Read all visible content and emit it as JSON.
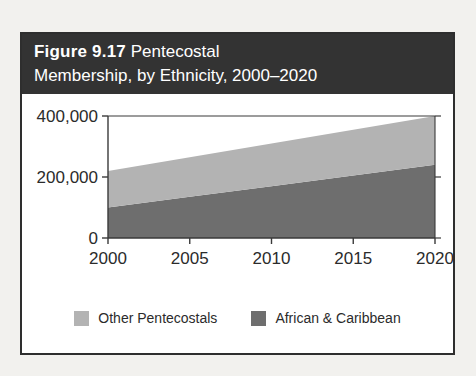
{
  "figure": {
    "caption_label": "Figure 9.17",
    "caption_text_line1": "Pentecostal",
    "caption_text_line2": "Membership, by Ethnicity, 2000–2020",
    "band_color": "#333333",
    "border_color": "#2e2e2e"
  },
  "legend": {
    "items": [
      {
        "label": "Other Pentecostals",
        "color": "#b3b3b3"
      },
      {
        "label": "African & Caribbean",
        "color": "#6e6e6e"
      }
    ]
  },
  "axes": {
    "y_ticks": [
      "0",
      "200,000",
      "400,000"
    ],
    "x_ticks": [
      "2000",
      "2005",
      "2010",
      "2015",
      "2020"
    ]
  },
  "chart_data": {
    "type": "area",
    "stacked": true,
    "title": "Figure 9.17 Pentecostal Membership, by Ethnicity, 2000–2020",
    "xlabel": "",
    "ylabel": "",
    "x": [
      2000,
      2005,
      2010,
      2015,
      2020
    ],
    "xlim": [
      2000,
      2020
    ],
    "ylim": [
      0,
      400000
    ],
    "yticks": [
      0,
      200000,
      400000
    ],
    "ytick_labels": [
      "0",
      "200,000",
      "400,000"
    ],
    "xticks": [
      2000,
      2005,
      2010,
      2015,
      2020
    ],
    "xtick_labels": [
      "2000",
      "2005",
      "2010",
      "2015",
      "2020"
    ],
    "grid": false,
    "legend_position": "bottom",
    "series": [
      {
        "name": "African & Caribbean",
        "color": "#6e6e6e",
        "values": [
          100000,
          135000,
          170000,
          205000,
          240000
        ]
      },
      {
        "name": "Other Pentecostals",
        "color": "#b3b3b3",
        "values": [
          120000,
          130000,
          140000,
          150000,
          160000
        ]
      }
    ],
    "stacked_totals": [
      220000,
      265000,
      310000,
      355000,
      400000
    ]
  }
}
